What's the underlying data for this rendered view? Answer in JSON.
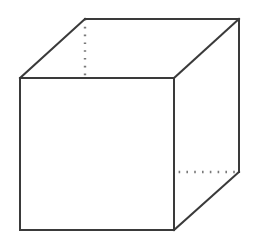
{
  "figure": {
    "background_color": "#ffffff",
    "solid_edge_color": "#3a3a3a",
    "hidden_edge_color": "#7a7a7a",
    "solid_edge_width": 2,
    "hidden_edge_width": 2.4,
    "canvas": {
      "width": 264,
      "height": 241
    }
  },
  "chart_data": {
    "type": "diagram",
    "projection": "oblique parallel projection",
    "vertices": {
      "front_top_left": {
        "x": 20,
        "y": 78,
        "hidden": false
      },
      "front_top_right": {
        "x": 174,
        "y": 78,
        "hidden": false
      },
      "front_bottom_left": {
        "x": 20,
        "y": 230,
        "hidden": false
      },
      "front_bottom_right": {
        "x": 174,
        "y": 230,
        "hidden": false
      },
      "back_top_left": {
        "x": 85,
        "y": 19,
        "hidden": false
      },
      "back_top_right": {
        "x": 239,
        "y": 19,
        "hidden": false
      },
      "back_bottom_right": {
        "x": 239,
        "y": 172,
        "hidden": false
      },
      "back_bottom_left": {
        "x": 85,
        "y": 172,
        "hidden": true
      }
    },
    "edges": [
      {
        "name": "front-top",
        "from": "front_top_left",
        "to": "front_top_right",
        "style": "solid"
      },
      {
        "name": "front-left",
        "from": "front_top_left",
        "to": "front_bottom_left",
        "style": "solid"
      },
      {
        "name": "front-right",
        "from": "front_top_right",
        "to": "front_bottom_right",
        "style": "solid"
      },
      {
        "name": "front-bottom",
        "from": "front_bottom_left",
        "to": "front_bottom_right",
        "style": "solid"
      },
      {
        "name": "back-top",
        "from": "back_top_left",
        "to": "back_top_right",
        "style": "solid"
      },
      {
        "name": "back-right",
        "from": "back_top_right",
        "to": "back_bottom_right",
        "style": "solid"
      },
      {
        "name": "top-left-diagonal",
        "from": "front_top_left",
        "to": "back_top_left",
        "style": "solid"
      },
      {
        "name": "top-right-diagonal",
        "from": "front_top_right",
        "to": "back_top_right",
        "style": "solid"
      },
      {
        "name": "bottom-right-diagonal",
        "from": "front_bottom_right",
        "to": "back_bottom_right",
        "style": "solid"
      },
      {
        "name": "back-left-vertical",
        "from": "back_top_left",
        "to": "back_bottom_left",
        "style": "dotted"
      },
      {
        "name": "back-bottom",
        "from": "back_bottom_left",
        "to": "back_bottom_right",
        "style": "dotted"
      },
      {
        "name": "bottom-left-diagonal",
        "from": "front_bottom_left",
        "to": "back_bottom_left",
        "style": "dotted"
      }
    ],
    "edge_count_total": 12,
    "edge_count_visible": 9,
    "edge_count_hidden": 3,
    "vertex_count": 8
  }
}
